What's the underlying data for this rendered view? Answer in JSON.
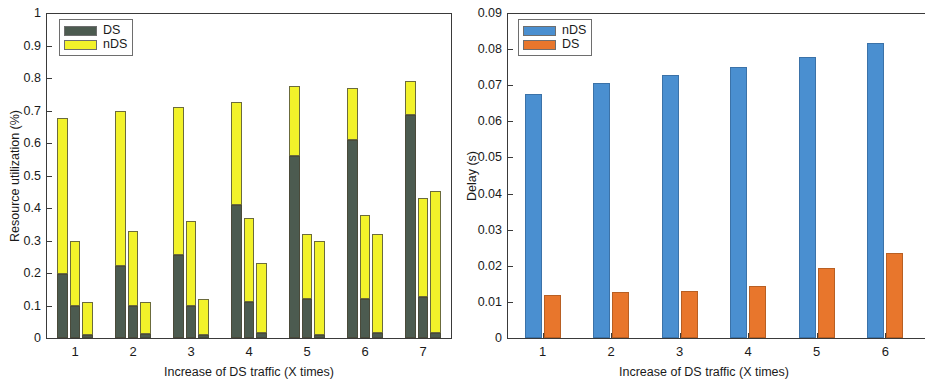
{
  "figure": {
    "panels": [
      "resource-utilization",
      "delay"
    ],
    "background": "#ffffff"
  },
  "colors": {
    "ds_green": "#4c5b50",
    "nds_yellow": "#f2f22a",
    "nds_blue": "#4a8fd0",
    "ds_orange": "#e8762c",
    "axis": "#3a3a3a",
    "text": "#1a1a1a"
  },
  "chart_data": [
    {
      "id": "resource-utilization",
      "type": "bar",
      "subtype": "stacked-grouped",
      "title": "",
      "xlabel": "Increase of DS traffic (X times)",
      "ylabel": "Resource utilization (%)",
      "categories": [
        "1",
        "2",
        "3",
        "4",
        "5",
        "6",
        "7"
      ],
      "bars_per_group": 3,
      "ylim": [
        0,
        1
      ],
      "yticks": [
        "0",
        "0.1",
        "0.2",
        "0.3",
        "0.4",
        "0.5",
        "0.6",
        "0.7",
        "0.8",
        "0.9",
        "1"
      ],
      "ytick_values": [
        0,
        0.1,
        0.2,
        0.3,
        0.4,
        0.5,
        0.6,
        0.7,
        0.8,
        0.9,
        1
      ],
      "grid": false,
      "legend": {
        "position": "top-left",
        "entries": [
          {
            "label": "DS",
            "color": "#4c5b50"
          },
          {
            "label": "nDS",
            "color": "#f2f22a"
          }
        ]
      },
      "series": [
        {
          "name": "DS",
          "color": "#4c5b50",
          "values": [
            [
              0.198,
              0.099,
              0.009
            ],
            [
              0.22,
              0.099,
              0.013
            ],
            [
              0.256,
              0.099,
              0.01
            ],
            [
              0.41,
              0.111,
              0.014
            ],
            [
              0.561,
              0.121,
              0.009
            ],
            [
              0.608,
              0.121,
              0.014
            ],
            [
              0.687,
              0.126,
              0.015
            ]
          ]
        },
        {
          "name": "nDS",
          "color": "#f2f22a",
          "values": [
            [
              0.48,
              0.201,
              0.102
            ],
            [
              0.478,
              0.231,
              0.098
            ],
            [
              0.456,
              0.261,
              0.11
            ],
            [
              0.315,
              0.258,
              0.217
            ],
            [
              0.215,
              0.2,
              0.289
            ],
            [
              0.16,
              0.258,
              0.306
            ],
            [
              0.104,
              0.304,
              0.437
            ]
          ]
        }
      ],
      "totals": [
        [
          0.678,
          0.3,
          0.111
        ],
        [
          0.698,
          0.33,
          0.111
        ],
        [
          0.712,
          0.36,
          0.12
        ],
        [
          0.725,
          0.369,
          0.231
        ],
        [
          0.776,
          0.321,
          0.298
        ],
        [
          0.768,
          0.379,
          0.32
        ],
        [
          0.791,
          0.43,
          0.452
        ]
      ]
    },
    {
      "id": "delay",
      "type": "bar",
      "subtype": "grouped",
      "title": "",
      "xlabel": "Increase of DS traffic (X times)",
      "ylabel": "Delay (s)",
      "categories": [
        "1",
        "2",
        "3",
        "4",
        "5",
        "6"
      ],
      "ylim": [
        0,
        0.09
      ],
      "yticks": [
        "0",
        "0.01",
        "0.02",
        "0.03",
        "0.04",
        "0.05",
        "0.06",
        "0.07",
        "0.08",
        "0.09"
      ],
      "ytick_values": [
        0,
        0.01,
        0.02,
        0.03,
        0.04,
        0.05,
        0.06,
        0.07,
        0.08,
        0.09
      ],
      "grid": false,
      "legend": {
        "position": "top-left",
        "entries": [
          {
            "label": "nDS",
            "color": "#4a8fd0"
          },
          {
            "label": "DS",
            "color": "#e8762c"
          }
        ]
      },
      "series": [
        {
          "name": "nDS",
          "color": "#4a8fd0",
          "values": [
            0.0675,
            0.0705,
            0.0727,
            0.075,
            0.0779,
            0.0816
          ]
        },
        {
          "name": "DS",
          "color": "#e8762c",
          "values": [
            0.0118,
            0.0127,
            0.013,
            0.0144,
            0.0194,
            0.0236
          ]
        }
      ]
    }
  ]
}
